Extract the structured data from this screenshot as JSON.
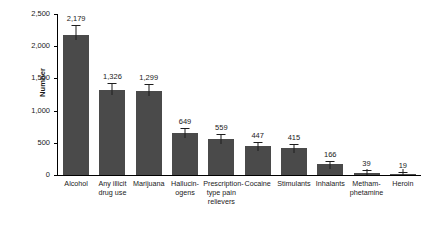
{
  "chart_data": {
    "type": "bar",
    "title": "",
    "xlabel": "",
    "ylabel": "Number",
    "ylim": [
      0,
      2500
    ],
    "yticks": [
      0,
      500,
      1000,
      1500,
      2000,
      2500
    ],
    "ytick_labels": [
      "0",
      "500",
      "1,000",
      "1,500",
      "2,000",
      "2,500"
    ],
    "grid": false,
    "legend": "none",
    "error_bars": true,
    "categories": [
      "Alcohol",
      "Any illicit drug use",
      "Marijuana",
      "Hallucinogens",
      "Prescription-type pain relievers",
      "Cocaine",
      "Stimulants",
      "Inhalants",
      "Methamphetamine",
      "Heroin"
    ],
    "category_lines": [
      [
        "Alcohol"
      ],
      [
        "Any illicit",
        "drug use"
      ],
      [
        "Marijuana"
      ],
      [
        "Hallucin-",
        "ogens"
      ],
      [
        "Prescription-",
        "type pain",
        "relievers"
      ],
      [
        "Cocaine"
      ],
      [
        "Stimulants"
      ],
      [
        "Inhalants"
      ],
      [
        "Metham-",
        "phetamine"
      ],
      [
        "Heroin"
      ]
    ],
    "values": [
      2179,
      1326,
      1299,
      649,
      559,
      447,
      415,
      166,
      39,
      19
    ],
    "value_labels": [
      "2,179",
      "1,326",
      "1,299",
      "649",
      "559",
      "447",
      "415",
      "166",
      "39",
      "19"
    ],
    "error_high": [
      2320,
      1420,
      1395,
      712,
      615,
      492,
      462,
      200,
      56,
      30
    ],
    "bar_color": "#4a4a4a",
    "axis_color": "#000000",
    "text_color": "#1a1a1a"
  }
}
